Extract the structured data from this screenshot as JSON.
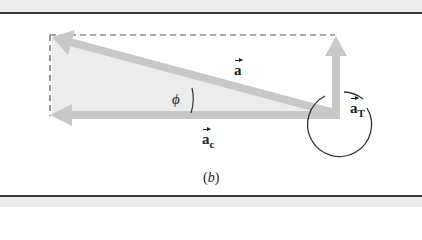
{
  "figure": {
    "caption_letter": "b",
    "caption_open": "(",
    "caption_close": ")",
    "labels": {
      "a": "a",
      "a_c_base": "a",
      "a_c_sub": "c",
      "a_t_base": "a",
      "a_t_sub": "T",
      "phi": "ϕ"
    },
    "colors": {
      "arrow": "#c8c8c8",
      "triangle_fill": "#ececec",
      "dash": "#555555",
      "rule": "#3a3a3a"
    }
  }
}
